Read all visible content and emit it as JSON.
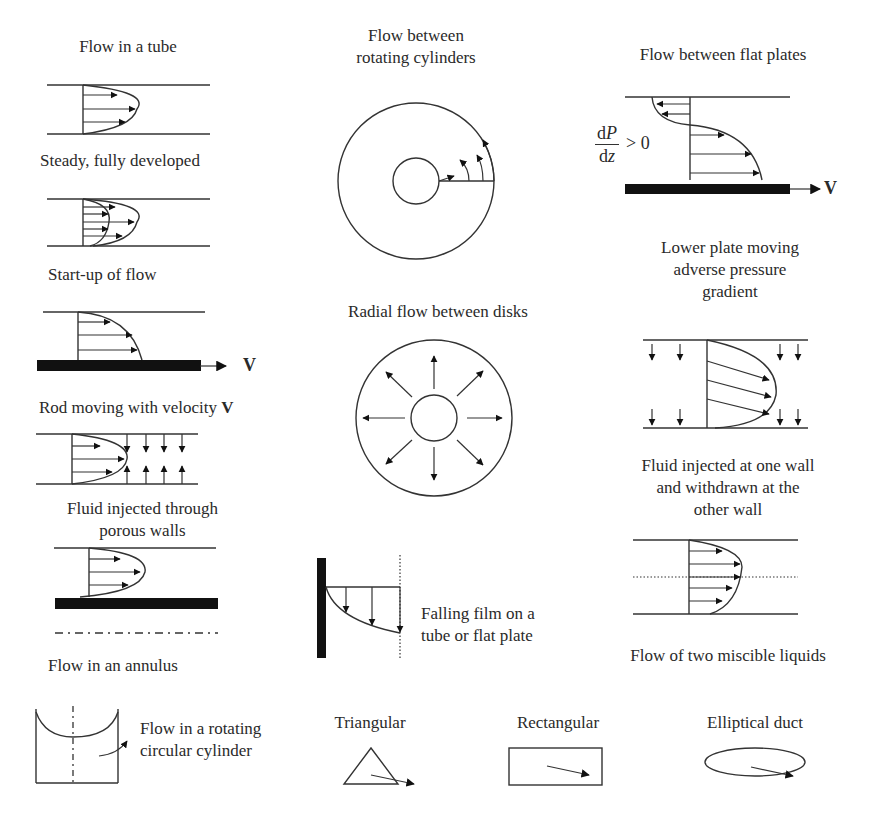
{
  "figure": {
    "panels": [
      {
        "id": "tube",
        "label": "Flow in a tube"
      },
      {
        "id": "steady",
        "label": "Steady, fully developed"
      },
      {
        "id": "startup",
        "label": "Start-up of flow"
      },
      {
        "id": "rod",
        "label": "Rod moving with velocity",
        "label_bold": "V"
      },
      {
        "id": "porous",
        "label_line1": "Fluid injected through",
        "label_line2": "porous walls"
      },
      {
        "id": "annulus",
        "label": "Flow in an annulus"
      },
      {
        "id": "rotating_cylinders",
        "label_line1": "Flow between",
        "label_line2": "rotating cylinders"
      },
      {
        "id": "radial",
        "label": "Radial flow between disks"
      },
      {
        "id": "falling_film",
        "label_line1": "Falling film on a",
        "label_line2": "tube or flat plate"
      },
      {
        "id": "flat_plates",
        "label": "Flow between flat plates"
      },
      {
        "id": "adverse",
        "label_line1": "Lower plate moving",
        "label_line2": "adverse pressure",
        "label_line3": "gradient"
      },
      {
        "id": "injected_withdrawn",
        "label_line1": "Fluid injected at one wall",
        "label_line2": "and withdrawn at the",
        "label_line3": "other wall"
      },
      {
        "id": "miscible",
        "label": "Flow of two miscible liquids"
      },
      {
        "id": "rotating_cylinder",
        "label_line1": "Flow in a rotating",
        "label_line2": "circular cylinder"
      },
      {
        "id": "triangular",
        "label": "Triangular"
      },
      {
        "id": "rectangular",
        "label": "Rectangular"
      },
      {
        "id": "elliptical",
        "label": "Elliptical duct"
      }
    ],
    "symbols": {
      "velocity": "V",
      "pressure_gradient_num_d": "d",
      "pressure_gradient_num_var": "P",
      "pressure_gradient_den_d": "d",
      "pressure_gradient_den_var": "z",
      "pressure_gradient_relation": "> 0"
    },
    "colors": {
      "ink": "#333333",
      "fill": "#111111",
      "background": "#ffffff"
    }
  }
}
